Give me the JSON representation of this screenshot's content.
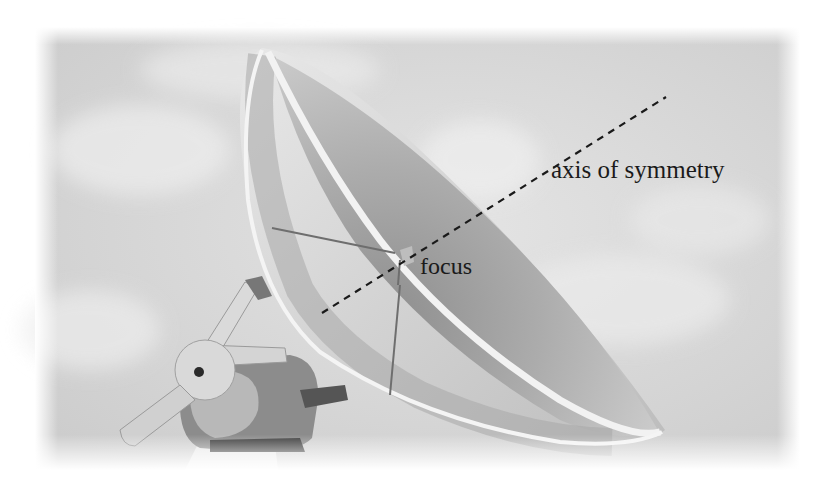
{
  "figure": {
    "colors": {
      "page_background": "#ffffff",
      "sky": "#dcdcdc",
      "dish_interior": "#a9a9a9",
      "dish_rim": "#efefef",
      "mount": "#8a8a8a",
      "label_text": "#1a1a1a",
      "dashed_line": "#1a1a1a"
    }
  },
  "annotations": {
    "axis_label": "axis of symmetry",
    "focus_label": "focus"
  },
  "axis_line": {
    "style": "dashed",
    "start": [
      322,
      313
    ],
    "end": [
      666,
      97
    ]
  },
  "focus_point": [
    410,
    257
  ]
}
